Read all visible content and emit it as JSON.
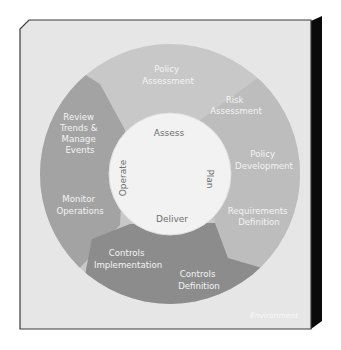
{
  "diagram": {
    "environment_label": "Environment",
    "inner_phases": {
      "top": "Assess",
      "right": "Plan",
      "bottom": "Deliver",
      "left": "Operate"
    },
    "ring_steps": [
      {
        "id": "policy-assessment",
        "lines": [
          "Policy",
          "Assessment"
        ]
      },
      {
        "id": "risk-assessment",
        "lines": [
          "Risk",
          "Assessment"
        ]
      },
      {
        "id": "policy-development",
        "lines": [
          "Policy",
          "Development"
        ]
      },
      {
        "id": "requirements-definition",
        "lines": [
          "Requirements",
          "Definition"
        ]
      },
      {
        "id": "controls-definition",
        "lines": [
          "Controls",
          "Definition"
        ]
      },
      {
        "id": "controls-implementation",
        "lines": [
          "Controls",
          "Implementation"
        ]
      },
      {
        "id": "monitor-operations",
        "lines": [
          "Monitor",
          "Operations"
        ]
      },
      {
        "id": "review-trends",
        "lines": [
          "Review",
          "Trends &",
          "Manage",
          "Events"
        ]
      }
    ],
    "colors": {
      "frame_background": "#e6e6e6",
      "frame_shadow": "#0a0a0a",
      "assess_region": "#c8c8c8",
      "plan_region": "#bdbdbd",
      "deliver_region": "#8c8c8c",
      "operate_region": "#a3a3a3",
      "inner_circle": "#f2f2f2"
    }
  }
}
